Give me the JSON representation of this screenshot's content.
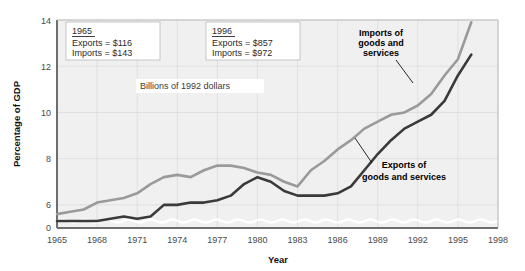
{
  "chart_data": {
    "type": "line",
    "title": "",
    "xlabel": "Year",
    "ylabel": "Percentage of GDP",
    "xlim": [
      1965,
      1998
    ],
    "ylim": [
      5.0,
      14.0
    ],
    "y_axis_break": true,
    "y_axis_break_note": "axis broken between 0 and the 6 gridline",
    "grid": true,
    "legend_position": "inline-annotations",
    "xticks": [
      "1965",
      "1968",
      "1971",
      "1974",
      "1977",
      "1980",
      "1983",
      "1986",
      "1989",
      "1992",
      "1995",
      "1998"
    ],
    "yticks": [
      "0",
      "6",
      "8",
      "10",
      "12",
      "14"
    ],
    "x": [
      1965,
      1966,
      1967,
      1968,
      1969,
      1970,
      1971,
      1972,
      1973,
      1974,
      1975,
      1976,
      1977,
      1978,
      1979,
      1980,
      1981,
      1982,
      1983,
      1984,
      1985,
      1986,
      1987,
      1988,
      1989,
      1990,
      1991,
      1992,
      1993,
      1994,
      1995,
      1996
    ],
    "series": [
      {
        "name": "Imports of goods and services",
        "color": "#9a9a9a",
        "values": [
          5.6,
          5.7,
          5.8,
          6.1,
          6.2,
          6.3,
          6.5,
          6.9,
          7.2,
          7.3,
          7.2,
          7.5,
          7.7,
          7.7,
          7.6,
          7.4,
          7.3,
          7.0,
          6.8,
          7.5,
          7.9,
          8.4,
          8.8,
          9.3,
          9.6,
          9.9,
          10.0,
          10.3,
          10.8,
          11.6,
          12.3,
          13.9
        ]
      },
      {
        "name": "Exports of goods and services",
        "color": "#3a3a3a",
        "values": [
          5.3,
          5.3,
          5.3,
          5.3,
          5.4,
          5.5,
          5.4,
          5.5,
          6.0,
          6.0,
          6.1,
          6.1,
          6.2,
          6.4,
          6.9,
          7.2,
          7.0,
          6.6,
          6.4,
          6.4,
          6.4,
          6.5,
          6.8,
          7.5,
          8.2,
          8.8,
          9.3,
          9.6,
          9.9,
          10.5,
          11.6,
          12.5
        ]
      }
    ],
    "annotations": {
      "box_1965": {
        "year": "1965",
        "exports": "Exports = $116",
        "imports": "Imports = $143"
      },
      "box_1996": {
        "year": "1996",
        "exports": "Exports = $857",
        "imports": "Imports = $972"
      },
      "units": "Billions of 1992 dollars",
      "imports_label": [
        "Imports of",
        "goods and",
        "services"
      ],
      "exports_label": [
        "Exports of",
        "goods and services"
      ]
    },
    "colors": {
      "imports": "#9a9a9a",
      "exports": "#3a3a3a",
      "plot_background": "#f0f0f0",
      "grid": "#dcdcdc",
      "axis": "#6e6e6e"
    }
  }
}
